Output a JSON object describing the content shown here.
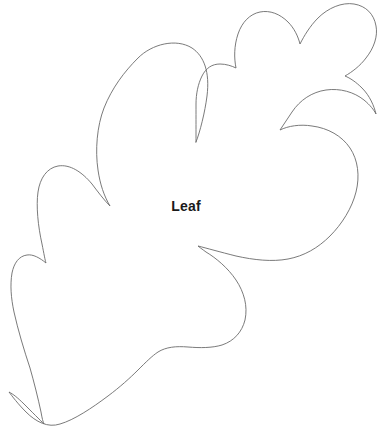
{
  "page": {
    "title": "Leaf",
    "background_color": "#ffffff",
    "width": 382,
    "height": 431
  },
  "figure": {
    "name": "leaf-outline",
    "label": "Leaf",
    "label_color": "#1a1a1a",
    "outline_color": "#6b6b6b",
    "fill_color": "#ffffff",
    "stroke_width": 0.9,
    "path": "M 196 142 C 200 132 205 112 207 96 C 210 72 204 56 192 48 C 176 38 152 44 138 58 C 124 72 112 88 104 108 C 97 126 95 150 98 170 C 100 184 104 196 110 206 C 104 200 98 192 92 184 C 82 172 70 164 58 166 C 47 168 40 178 38 192 C 36 206 38 226 42 244 C 44 254 45 260 46 263 C 40 258 33 254 27 255 C 19 256 14 263 12 273 C 10 285 11 298 14 312 C 18 330 24 350 30 368 C 34 382 38 398 41 412 C 42 418 43 422 44 424 C 40 420 32 412 24 404 C 18 398 13 394 9 392 C 12 396 18 404 26 412 C 36 422 48 428 60 424 C 74 420 92 408 108 396 C 120 387 130 378 138 370 C 146 362 152 356 158 352 C 166 347 176 346 188 347 C 200 348 212 348 222 345 C 234 341 242 332 245 320 C 248 306 244 292 236 280 C 228 268 216 258 206 252 C 202 249 199 247 198 246 C 206 248 220 252 236 256 C 254 260 272 262 288 259 C 304 256 318 248 330 236 C 342 224 352 208 356 192 C 360 176 358 160 350 148 C 342 136 328 128 312 126 C 300 124 288 126 280 130 C 284 124 288 118 292 112 C 300 100 312 92 326 90 C 340 88 354 92 364 100 C 370 105 374 110 376 114 C 374 106 370 96 362 88 C 356 82 350 78 345 76 C 352 72 360 66 366 58 C 374 48 378 36 376 26 C 374 14 366 6 354 4 C 342 2 328 8 318 18 C 310 26 304 36 300 44 C 298 36 294 28 288 22 C 280 14 270 10 260 12 C 250 14 242 22 238 34 C 234 46 234 58 236 68 C 232 66 226 64 220 64 C 212 64 206 68 202 76 C 198 84 196 94 196 104 C 196 118 196 132 196 142 Z"
  },
  "annotations": {
    "label_position": {
      "x": 186,
      "y": 211
    },
    "label_font_size": 14,
    "label_font_weight": "bold"
  }
}
